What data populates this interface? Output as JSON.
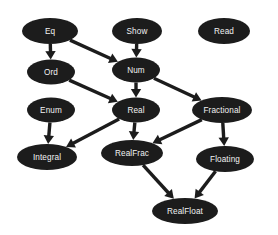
{
  "diagram": {
    "type": "directed-graph",
    "background_color": "#ffffff",
    "node_fill_color": "#1c1c1c",
    "node_text_color": "#f2f2f2",
    "edge_color": "#1c1c1c",
    "nodes": [
      {
        "id": "eq",
        "label": "Eq",
        "cx": 50,
        "cy": 31,
        "rx": 28,
        "ry": 13
      },
      {
        "id": "show",
        "label": "Show",
        "cx": 137,
        "cy": 31,
        "rx": 25,
        "ry": 13
      },
      {
        "id": "read",
        "label": "Read",
        "cx": 224,
        "cy": 31,
        "rx": 26,
        "ry": 13
      },
      {
        "id": "ord",
        "label": "Ord",
        "cx": 51,
        "cy": 72,
        "rx": 24,
        "ry": 12.5
      },
      {
        "id": "num",
        "label": "Num",
        "cx": 136,
        "cy": 70,
        "rx": 24,
        "ry": 12.5
      },
      {
        "id": "enum",
        "label": "Enum",
        "cx": 51,
        "cy": 110,
        "rx": 24,
        "ry": 12.5
      },
      {
        "id": "real",
        "label": "Real",
        "cx": 136,
        "cy": 110,
        "rx": 24,
        "ry": 12.5
      },
      {
        "id": "fractional",
        "label": "Fractional",
        "cx": 222,
        "cy": 110,
        "rx": 30,
        "ry": 13
      },
      {
        "id": "integral",
        "label": "Integral",
        "cx": 47,
        "cy": 157,
        "rx": 30,
        "ry": 13
      },
      {
        "id": "realfrac",
        "label": "RealFrac",
        "cx": 132,
        "cy": 153,
        "rx": 31,
        "ry": 13
      },
      {
        "id": "floating",
        "label": "Floating",
        "cx": 225,
        "cy": 159,
        "rx": 29,
        "ry": 13
      },
      {
        "id": "realfloat",
        "label": "RealFloat",
        "cx": 185,
        "cy": 211,
        "rx": 33,
        "ry": 13
      }
    ],
    "edges": [
      {
        "from": "eq",
        "to": "ord",
        "style": "vertical"
      },
      {
        "from": "eq",
        "to": "num",
        "style": "diagonal"
      },
      {
        "from": "show",
        "to": "num",
        "style": "vertical"
      },
      {
        "from": "ord",
        "to": "real",
        "style": "diagonal"
      },
      {
        "from": "num",
        "to": "real",
        "style": "vertical"
      },
      {
        "from": "num",
        "to": "fractional",
        "style": "diagonal"
      },
      {
        "from": "enum",
        "to": "integral",
        "style": "vertical"
      },
      {
        "from": "real",
        "to": "integral",
        "style": "diagonal"
      },
      {
        "from": "real",
        "to": "realfrac",
        "style": "vertical"
      },
      {
        "from": "fractional",
        "to": "realfrac",
        "style": "diagonal"
      },
      {
        "from": "fractional",
        "to": "floating",
        "style": "vertical"
      },
      {
        "from": "realfrac",
        "to": "realfloat",
        "style": "diagonal"
      },
      {
        "from": "floating",
        "to": "realfloat",
        "style": "diagonal"
      }
    ]
  }
}
